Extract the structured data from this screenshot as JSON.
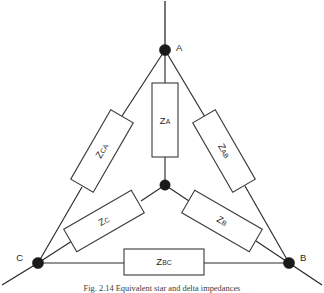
{
  "figure": {
    "type": "electrical-circuit-diagram",
    "caption": "Fig. 2.14   Equivalent star and delta impedances",
    "background_color": "#ffffff",
    "line_color": "#2a2a2a",
    "node_color": "#1a1a1a",
    "box_fill": "#ffffff",
    "box_stroke": "#3a3a3a"
  },
  "terminals": [
    {
      "id": "A",
      "label": "A",
      "x": 165,
      "y": 50,
      "label_x": 176,
      "label_y": 48
    },
    {
      "id": "B",
      "label": "B",
      "x": 289,
      "y": 263,
      "label_x": 300,
      "label_y": 258
    },
    {
      "id": "C",
      "label": "C",
      "x": 38,
      "y": 263,
      "label_x": 23,
      "label_y": 258
    }
  ],
  "nodes": [
    {
      "id": "neutral",
      "label": "",
      "x": 165,
      "y": 185,
      "radius": 5.2
    },
    {
      "id": "A",
      "label": "A",
      "x": 165,
      "y": 50,
      "radius": 5.6
    },
    {
      "id": "B",
      "label": "B",
      "x": 289,
      "y": 263,
      "radius": 5.6
    },
    {
      "id": "C",
      "label": "C",
      "x": 38,
      "y": 263,
      "radius": 5.6
    }
  ],
  "external_leads": [
    {
      "from": "A",
      "x1": 165,
      "y1": 50,
      "x2": 165,
      "y2": 1
    },
    {
      "from": "B",
      "x1": 289,
      "y1": 263,
      "x2": 322,
      "y2": 285
    },
    {
      "from": "C",
      "x1": 38,
      "y1": 263,
      "x2": 2,
      "y2": 285
    }
  ],
  "components": [
    {
      "id": "ZA",
      "symbol": "Z",
      "subscript": "A",
      "connection": "star",
      "between": [
        "A",
        "neutral"
      ],
      "cx": 165,
      "cy": 120,
      "width": 26,
      "height": 74,
      "rotation": 0,
      "label_rotation": 0
    },
    {
      "id": "ZB",
      "symbol": "Z",
      "subscript": "B",
      "connection": "star",
      "between": [
        "neutral",
        "B"
      ],
      "cx": 222,
      "cy": 221,
      "width": 78,
      "height": 26,
      "rotation": 30,
      "label_rotation": 30
    },
    {
      "id": "ZC",
      "symbol": "Z",
      "subscript": "C",
      "connection": "star",
      "between": [
        "neutral",
        "C"
      ],
      "cx": 104,
      "cy": 221,
      "width": 78,
      "height": 26,
      "rotation": -30,
      "label_rotation": -30
    },
    {
      "id": "ZAB",
      "symbol": "Z",
      "subscript": "AB",
      "connection": "delta",
      "between": [
        "A",
        "B"
      ],
      "cx": 224,
      "cy": 151,
      "width": 80,
      "height": 26,
      "rotation": 60,
      "label_rotation": 60
    },
    {
      "id": "ZBC",
      "symbol": "Z",
      "subscript": "BC",
      "connection": "delta",
      "between": [
        "B",
        "C"
      ],
      "cx": 164,
      "cy": 262,
      "width": 80,
      "height": 26,
      "rotation": 0,
      "label_rotation": 0
    },
    {
      "id": "ZCA",
      "symbol": "Z",
      "subscript": "CA",
      "connection": "delta",
      "between": [
        "C",
        "A"
      ],
      "cx": 102,
      "cy": 151,
      "width": 80,
      "height": 26,
      "rotation": -60,
      "label_rotation": -60
    }
  ],
  "edges": [
    {
      "id": "edge-A-neutral",
      "from": "A",
      "to": "neutral",
      "type": "star"
    },
    {
      "id": "edge-B-neutral",
      "from": "neutral",
      "to": "B",
      "type": "star"
    },
    {
      "id": "edge-C-neutral",
      "from": "neutral",
      "to": "C",
      "type": "star"
    },
    {
      "id": "edge-A-B",
      "from": "A",
      "to": "B",
      "type": "delta"
    },
    {
      "id": "edge-B-C",
      "from": "B",
      "to": "C",
      "type": "delta"
    },
    {
      "id": "edge-C-A",
      "from": "C",
      "to": "A",
      "type": "delta"
    }
  ]
}
